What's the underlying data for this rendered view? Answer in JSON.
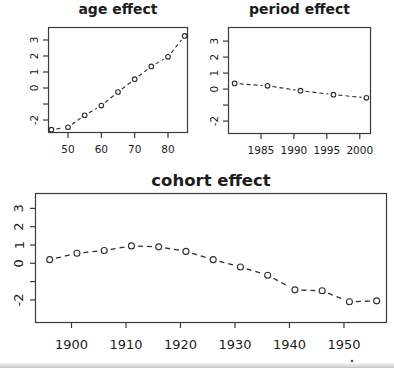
{
  "window": {
    "background": "#ffffff"
  },
  "plot_style": {
    "ink_color": "#2e2e2e",
    "box_color": "#3a3a3a",
    "text_color": "#1c1c1c",
    "marker": "open-circle",
    "line_type": "dashed",
    "grid": "off",
    "legend": "none"
  },
  "stray_mark": {
    "x": 352,
    "y": 361
  },
  "chart_data": [
    {
      "id": "age",
      "type": "line",
      "title": "age effect",
      "xlabel": "",
      "ylabel": "",
      "x": [
        45,
        50,
        55,
        60,
        65,
        70,
        75,
        80,
        85
      ],
      "values": [
        -2.6,
        -2.45,
        -1.7,
        -1.1,
        -0.25,
        0.55,
        1.35,
        1.95,
        3.25
      ],
      "xticks": [
        50,
        60,
        70,
        80
      ],
      "yticks": [
        -2,
        -1,
        0,
        1,
        2,
        3
      ],
      "ytick_labels": [
        "-2",
        "",
        "0",
        "1",
        "2",
        "3"
      ],
      "xlim": [
        44,
        86
      ],
      "ylim": [
        -2.81,
        3.81
      ]
    },
    {
      "id": "period",
      "type": "line",
      "title": "period effect",
      "xlabel": "",
      "ylabel": "",
      "x": [
        1981,
        1986,
        1991,
        1996,
        2001
      ],
      "values": [
        0.35,
        0.2,
        -0.1,
        -0.35,
        -0.55
      ],
      "xticks": [
        1985,
        1990,
        1995,
        2000
      ],
      "yticks": [
        -2,
        -1,
        0,
        1,
        2,
        3
      ],
      "ytick_labels": [
        "-2",
        "",
        "0",
        "1",
        "2",
        "3"
      ],
      "xlim": [
        1980,
        2001.7
      ],
      "ylim": [
        -2.81,
        3.88
      ]
    },
    {
      "id": "cohort",
      "type": "line",
      "title": "cohort effect",
      "xlabel": "",
      "ylabel": "",
      "x": [
        1896,
        1901,
        1906,
        1911,
        1916,
        1921,
        1926,
        1931,
        1936,
        1941,
        1946,
        1951,
        1956
      ],
      "values": [
        0.2,
        0.55,
        0.7,
        0.95,
        0.9,
        0.65,
        0.2,
        -0.2,
        -0.65,
        -1.45,
        -1.5,
        -2.1,
        -2.05
      ],
      "xticks": [
        1900,
        1910,
        1920,
        1930,
        1940,
        1950
      ],
      "yticks": [
        -2,
        -1,
        0,
        1,
        2,
        3
      ],
      "ytick_labels": [
        "-2",
        "",
        "0",
        "1",
        "2",
        "3"
      ],
      "xlim": [
        1893.3,
        1957.9
      ],
      "ylim": [
        -3.26,
        3.84
      ]
    }
  ]
}
